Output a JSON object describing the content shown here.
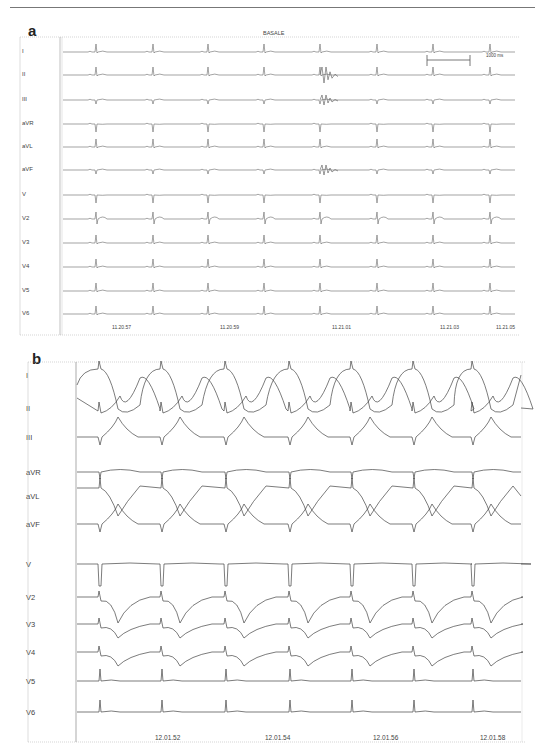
{
  "figure": {
    "panel_a": {
      "label": "a",
      "title": "BASALE",
      "scale_bar": "1000 ms",
      "leads": [
        "I",
        "II",
        "III",
        "aVR",
        "aVL",
        "aVF",
        "V",
        "V2",
        "V3",
        "V4",
        "V5",
        "V6"
      ],
      "timestamps": [
        "11.20.57",
        "11.20.59",
        "11.21.01",
        "11.21.03",
        "11.21.05"
      ]
    },
    "panel_b": {
      "label": "b",
      "leads": [
        "I",
        "II",
        "III",
        "aVR",
        "aVL",
        "aVF",
        "V",
        "V2",
        "V3",
        "V4",
        "V5",
        "V6"
      ],
      "timestamps": [
        "12.01.52",
        "12.01.54",
        "12.01.56",
        "12.01.58"
      ]
    }
  },
  "chart_data": [
    {
      "type": "line",
      "title": "BASALE",
      "subtitle": "Panel a — 12-lead ECG, baseline",
      "series": [
        "I",
        "II",
        "III",
        "aVR",
        "aVL",
        "aVF",
        "V",
        "V2",
        "V3",
        "V4",
        "V5",
        "V6"
      ],
      "x_tick_labels": [
        "11.20.57",
        "11.20.59",
        "11.21.01",
        "11.21.03",
        "11.21.05"
      ],
      "annotations": [
        "1000 ms scale bar",
        "artifact burst in II/III/aVF near 11.21.01"
      ],
      "beats_visible": 8,
      "grid": false
    },
    {
      "type": "line",
      "title": "",
      "subtitle": "Panel b — 12-lead ECG, wide T-wave inversions V2–V4",
      "series": [
        "I",
        "II",
        "III",
        "aVR",
        "aVL",
        "aVF",
        "V",
        "V2",
        "V3",
        "V4",
        "V5",
        "V6"
      ],
      "x_tick_labels": [
        "12.01.52",
        "12.01.54",
        "12.01.56",
        "12.01.58"
      ],
      "beats_visible": 7,
      "grid": false
    }
  ]
}
